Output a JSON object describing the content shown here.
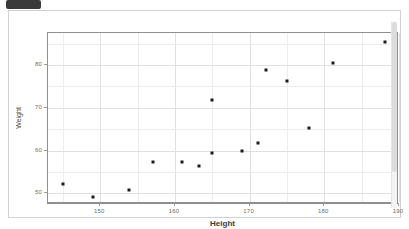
{
  "window": {
    "badge_label": ""
  },
  "chart_data": {
    "type": "scatter",
    "title": "",
    "xlabel": "Height",
    "ylabel": "Weight",
    "xlim": [
      143,
      190
    ],
    "ylim": [
      47.5,
      87.5
    ],
    "xticks": [
      150,
      160,
      170,
      180,
      190
    ],
    "yticks": [
      50,
      60,
      70,
      80
    ],
    "xtick_labels": [
      "150",
      "160",
      "170",
      "180",
      "190"
    ],
    "ytick_labels": [
      "50",
      "60",
      "70",
      "80"
    ],
    "grid": true,
    "legend": null,
    "marker": "square",
    "marker_color": "#1b1b1b",
    "points": [
      {
        "x": 145.0,
        "y": 52.1
      },
      {
        "x": 149.0,
        "y": 49.1
      },
      {
        "x": 153.8,
        "y": 50.7
      },
      {
        "x": 157.1,
        "y": 57.3
      },
      {
        "x": 161.0,
        "y": 57.3
      },
      {
        "x": 163.2,
        "y": 56.4
      },
      {
        "x": 165.0,
        "y": 59.4
      },
      {
        "x": 165.0,
        "y": 71.8
      },
      {
        "x": 169.0,
        "y": 59.9
      },
      {
        "x": 171.1,
        "y": 61.7
      },
      {
        "x": 172.2,
        "y": 78.8
      },
      {
        "x": 175.0,
        "y": 76.3
      },
      {
        "x": 177.9,
        "y": 65.3
      },
      {
        "x": 181.2,
        "y": 80.4
      },
      {
        "x": 188.1,
        "y": 85.3
      }
    ]
  }
}
